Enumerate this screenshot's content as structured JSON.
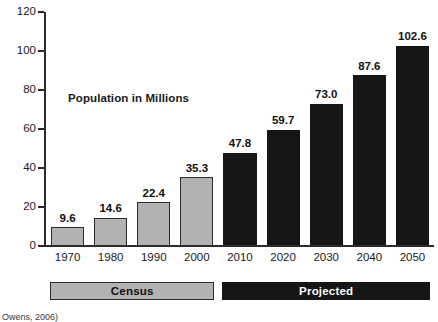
{
  "chart_data": {
    "type": "bar",
    "title": "",
    "annotation": "Population in Millions",
    "xlabel": "",
    "ylabel": "",
    "ylim": [
      0,
      120
    ],
    "ytick_step": 20,
    "yticks": [
      0,
      20,
      40,
      60,
      80,
      100,
      120
    ],
    "ytick_labels": [
      "0",
      "20",
      "40",
      "60",
      "80",
      "100",
      "120"
    ],
    "grid": false,
    "legend_position": "below-axis",
    "categories": [
      "1970",
      "1980",
      "1990",
      "2000",
      "2010",
      "2020",
      "2030",
      "2040",
      "2050"
    ],
    "values": [
      9.6,
      14.6,
      22.4,
      35.3,
      47.8,
      59.7,
      73.0,
      87.6,
      102.6
    ],
    "value_labels": [
      "9.6",
      "14.6",
      "22.4",
      "35.3",
      "47.8",
      "59.7",
      "73.0",
      "87.6",
      "102.6"
    ],
    "groups": [
      {
        "name": "Census",
        "label": "Census",
        "color": "#b2b2b2",
        "text_color": "#111111",
        "categories": [
          "1970",
          "1980",
          "1990",
          "2000"
        ],
        "values": [
          9.6,
          14.6,
          22.4,
          35.3
        ]
      },
      {
        "name": "Projected",
        "label": "Projected",
        "color": "#161616",
        "text_color": "#ffffff",
        "categories": [
          "2010",
          "2020",
          "2030",
          "2040",
          "2050"
        ],
        "values": [
          47.8,
          59.7,
          73.0,
          87.6,
          102.6
        ]
      }
    ],
    "bars": [
      {
        "category": "1970",
        "value": 9.6,
        "label": "9.6",
        "group": "Census"
      },
      {
        "category": "1980",
        "value": 14.6,
        "label": "14.6",
        "group": "Census"
      },
      {
        "category": "1990",
        "value": 22.4,
        "label": "22.4",
        "group": "Census"
      },
      {
        "category": "2000",
        "value": 35.3,
        "label": "35.3",
        "group": "Census"
      },
      {
        "category": "2010",
        "value": 47.8,
        "label": "47.8",
        "group": "Projected"
      },
      {
        "category": "2020",
        "value": 59.7,
        "label": "59.7",
        "group": "Projected"
      },
      {
        "category": "2030",
        "value": 73.0,
        "label": "73.0",
        "group": "Projected"
      },
      {
        "category": "2040",
        "value": 87.6,
        "label": "87.6",
        "group": "Projected"
      },
      {
        "category": "2050",
        "value": 102.6,
        "label": "102.6",
        "group": "Projected"
      }
    ]
  },
  "source": {
    "text": "Owens, 2006)"
  },
  "colors": {
    "census_fill": "#b2b2b2",
    "projected_fill": "#161616",
    "axis": "#2b2b2b",
    "text": "#1a1a1a",
    "background": "#ffffff"
  }
}
